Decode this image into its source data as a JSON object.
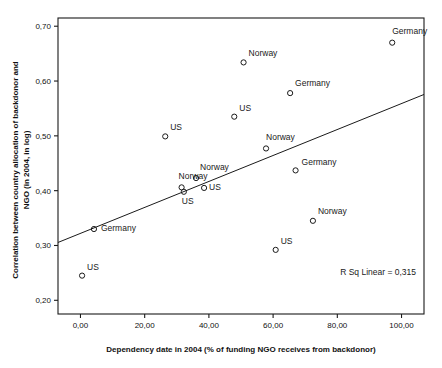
{
  "chart_data": {
    "type": "scatter",
    "title": "",
    "xlabel": "Dependency date in 2004 (% of funding NGO receives from backdonor)",
    "ylabel": "Correlation between country allocation of backdonor and NGO (in 2004, in log)",
    "xlim": [
      -7,
      107
    ],
    "ylim": [
      0.175,
      0.715
    ],
    "xticks": [
      0,
      20,
      40,
      60,
      80,
      100
    ],
    "xtick_labels": [
      "0,00",
      "20,00",
      "40,00",
      "60,00",
      "80,00",
      "100,00"
    ],
    "yticks": [
      0.2,
      0.3,
      0.4,
      0.5,
      0.6,
      0.7
    ],
    "ytick_labels": [
      "0,20",
      "0,30",
      "0,40",
      "0,50",
      "0,60",
      "0,70"
    ],
    "grid": false,
    "legend": "none",
    "decimal_separator": ",",
    "annotation": "R Sq Linear = 0,315",
    "fit_line": {
      "type": "linear",
      "x_start": -7,
      "y_start": 0.3055,
      "x_end": 107,
      "y_end": 0.5755
    },
    "points": [
      {
        "label": "US",
        "x": 0.5,
        "y": 0.245,
        "label_dx": 5,
        "label_dy": -6
      },
      {
        "label": "Germany",
        "x": 4.2,
        "y": 0.33,
        "label_dx": 7,
        "label_dy": 2
      },
      {
        "label": "US",
        "x": 26.4,
        "y": 0.499,
        "label_dx": 5,
        "label_dy": -6
      },
      {
        "label": "Norway",
        "x": 31.5,
        "y": 0.406,
        "label_dx": -3,
        "label_dy": -8
      },
      {
        "label": "US",
        "x": 32.2,
        "y": 0.398,
        "label_dx": -2,
        "label_dy": 12
      },
      {
        "label": "Norway",
        "x": 36.0,
        "y": 0.423,
        "label_dx": 4,
        "label_dy": -8
      },
      {
        "label": "US",
        "x": 38.5,
        "y": 0.405,
        "label_dx": 5,
        "label_dy": 2
      },
      {
        "label": "US",
        "x": 47.9,
        "y": 0.535,
        "label_dx": 5,
        "label_dy": -6
      },
      {
        "label": "Norway",
        "x": 50.8,
        "y": 0.634,
        "label_dx": 5,
        "label_dy": -6
      },
      {
        "label": "Norway",
        "x": 57.8,
        "y": 0.477,
        "label_dx": 0,
        "label_dy": -8
      },
      {
        "label": "US",
        "x": 60.8,
        "y": 0.292,
        "label_dx": 5,
        "label_dy": -6
      },
      {
        "label": "Germany",
        "x": 65.3,
        "y": 0.578,
        "label_dx": 5,
        "label_dy": -7
      },
      {
        "label": "Germany",
        "x": 67.0,
        "y": 0.437,
        "label_dx": 6,
        "label_dy": -5
      },
      {
        "label": "Norway",
        "x": 72.4,
        "y": 0.345,
        "label_dx": 5,
        "label_dy": -7
      },
      {
        "label": "Germany",
        "x": 97.1,
        "y": 0.67,
        "label_dx": 0,
        "label_dy": -9
      }
    ]
  }
}
